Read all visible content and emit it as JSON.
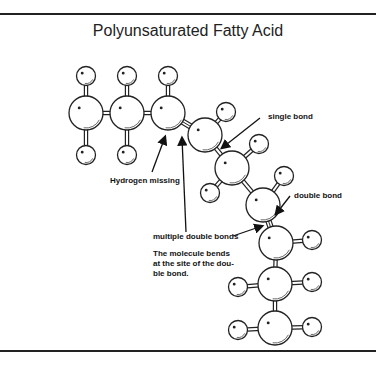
{
  "title": "Polyunsaturated Fatty Acid",
  "labels": {
    "single_bond": "single bond",
    "hydrogen_missing": "Hydrogen missing",
    "double_bond": "double bond",
    "multiple_double_bonds": "multiple double bonds",
    "note_line1": "The molecule bends",
    "note_line2": "at the site of the dou-",
    "note_line3": "ble bond."
  },
  "molecule": {
    "carbons": [
      {
        "id": "C1",
        "x": 86,
        "y": 113
      },
      {
        "id": "C2",
        "x": 127,
        "y": 113
      },
      {
        "id": "C3",
        "x": 168,
        "y": 113
      },
      {
        "id": "C4",
        "x": 205,
        "y": 135
      },
      {
        "id": "C5",
        "x": 232,
        "y": 168
      },
      {
        "id": "C6",
        "x": 263,
        "y": 205
      },
      {
        "id": "C7",
        "x": 276,
        "y": 243
      },
      {
        "id": "C8",
        "x": 275,
        "y": 284
      },
      {
        "id": "C9",
        "x": 275,
        "y": 328
      }
    ],
    "hydrogens": [
      {
        "bonded_to": "C1",
        "x": 86,
        "y": 76
      },
      {
        "bonded_to": "C1",
        "x": 86,
        "y": 155
      },
      {
        "bonded_to": "C2",
        "x": 127,
        "y": 76
      },
      {
        "bonded_to": "C2",
        "x": 127,
        "y": 155
      },
      {
        "bonded_to": "C3",
        "x": 168,
        "y": 76
      },
      {
        "bonded_to": "C4",
        "x": 226,
        "y": 112
      },
      {
        "bonded_to": "C5",
        "x": 259,
        "y": 144
      },
      {
        "bonded_to": "C5",
        "x": 210,
        "y": 193
      },
      {
        "bonded_to": "C6",
        "x": 284,
        "y": 176
      },
      {
        "bonded_to": "C7",
        "x": 312,
        "y": 240
      },
      {
        "bonded_to": "C8",
        "x": 312,
        "y": 282
      },
      {
        "bonded_to": "C8",
        "x": 238,
        "y": 287
      },
      {
        "bonded_to": "C9",
        "x": 312,
        "y": 327
      },
      {
        "bonded_to": "C9",
        "x": 238,
        "y": 330
      }
    ],
    "double_bonds": [
      [
        "C3",
        "C4"
      ],
      [
        "C6",
        "C7"
      ]
    ]
  },
  "colors": {
    "line": "#222222",
    "fill": "#ffffff"
  }
}
